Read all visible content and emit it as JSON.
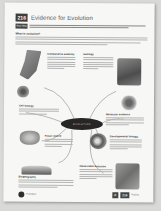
{
  "page": {
    "number": "216",
    "title": "Evidence for Evolution",
    "key_idea_label": "Key Idea",
    "intro_heading": "What is evolution?",
    "center_label": "EVOLUTION"
  },
  "sections": [
    {
      "id": "anatomy",
      "heading": "Comparative anatomy"
    },
    {
      "id": "geology",
      "heading": "Geology"
    },
    {
      "id": "cell-biology",
      "heading": "Cell biology"
    },
    {
      "id": "molecular",
      "heading": "Molecular evidence"
    },
    {
      "id": "fossil",
      "heading": "Fossil record"
    },
    {
      "id": "development",
      "heading": "Developmental biology"
    },
    {
      "id": "biogeography",
      "heading": "Biogeography"
    },
    {
      "id": "observation",
      "heading": "Observable evolution"
    }
  ],
  "footer": {
    "badge_left": "P",
    "badge_right": "216",
    "label": "Activity",
    "publisher": "Publisher"
  },
  "colors": {
    "paper": "#f7f7f5",
    "ink": "#333333",
    "badge": "#3d3d3d",
    "oval": "#262626"
  }
}
